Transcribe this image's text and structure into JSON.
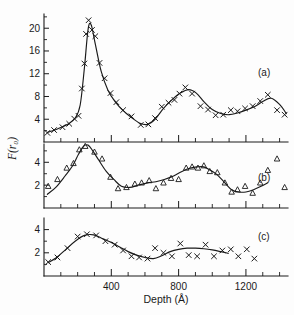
{
  "figure": {
    "title": "",
    "xlabel": "Depth (Å)",
    "ylabel": "F(r₀)",
    "panel_labels": [
      "(a)",
      "(b)",
      "(c)"
    ],
    "ink_color": "#1a1a1a",
    "background_color": "#fdfdfd"
  },
  "axis": {
    "x_ticks_major": [
      "400",
      "800",
      "1200"
    ],
    "x_tick_major_values": [
      400,
      800,
      1200
    ],
    "x_tick_minor_values": [
      100,
      200,
      300,
      500,
      600,
      700,
      900,
      1000,
      1100,
      1300,
      1400
    ],
    "x_range": [
      0,
      1450
    ],
    "panel_a_y_ticks": [
      "4",
      "8",
      "12",
      "16",
      "20"
    ],
    "panel_a_y_tick_values": [
      4,
      8,
      12,
      16,
      20
    ],
    "panel_b_y_ticks": [
      "2",
      "4"
    ],
    "panel_b_y_tick_values": [
      2,
      4
    ],
    "panel_c_y_ticks": [
      "2",
      "4"
    ],
    "panel_c_y_tick_values": [
      2,
      4
    ]
  },
  "chart_data": [
    {
      "type": "scatter",
      "panel": "(a)",
      "title": "",
      "xlabel": "Depth (Å)",
      "ylabel": "F(r₀)",
      "xlim": [
        0,
        1450
      ],
      "ylim": [
        0,
        22.5
      ],
      "grid": false,
      "legend": "none",
      "marker": "x",
      "series": [
        {
          "name": "data-a",
          "marker": "x",
          "x": [
            20,
            60,
            110,
            150,
            180,
            205,
            225,
            240,
            250,
            265,
            285,
            305,
            330,
            360,
            395,
            430,
            470,
            520,
            575,
            620,
            660,
            700,
            740,
            775,
            805,
            840,
            880,
            930,
            975,
            1020,
            1065,
            1110,
            1150,
            1195,
            1240,
            1285,
            1330,
            1385,
            1430
          ],
          "y": [
            1.6,
            2.1,
            2.6,
            3.2,
            4.1,
            4.6,
            9.4,
            13.8,
            19.0,
            21.4,
            19.7,
            18.6,
            13.9,
            11.2,
            8.6,
            7.0,
            5.6,
            4.5,
            3.0,
            3.1,
            4.2,
            6.2,
            6.9,
            7.4,
            8.5,
            9.6,
            8.5,
            6.3,
            5.7,
            4.7,
            4.8,
            5.6,
            5.4,
            5.9,
            6.3,
            7.2,
            8.3,
            5.6,
            4.8
          ]
        }
      ],
      "fitted_curve": {
        "name": "fit-a",
        "x": [
          20,
          80,
          140,
          185,
          215,
          240,
          262,
          280,
          305,
          340,
          380,
          425,
          470,
          520,
          570,
          615,
          660,
          710,
          760,
          810,
          860,
          905,
          950,
          1000,
          1050,
          1100,
          1150,
          1200,
          1250,
          1300,
          1350,
          1400,
          1440
        ],
        "y": [
          1.7,
          2.3,
          3.1,
          4.2,
          6.5,
          13.0,
          19.8,
          20.6,
          17.2,
          12.4,
          9.1,
          7.0,
          5.5,
          4.3,
          3.3,
          3.1,
          4.0,
          5.9,
          7.4,
          8.6,
          9.2,
          8.6,
          7.1,
          5.7,
          5.0,
          4.8,
          5.1,
          5.6,
          6.2,
          7.1,
          7.7,
          6.6,
          5.0
        ]
      }
    },
    {
      "type": "scatter",
      "panel": "(b)",
      "title": "",
      "xlabel": "Depth (Å)",
      "ylabel": "F(r₀)",
      "xlim": [
        0,
        1450
      ],
      "ylim": [
        0,
        5.6
      ],
      "grid": false,
      "legend": "none",
      "marker": "triangle",
      "series": [
        {
          "name": "data-b",
          "marker": "triangle",
          "x": [
            25,
            80,
            135,
            175,
            210,
            245,
            300,
            345,
            395,
            440,
            490,
            540,
            580,
            625,
            665,
            710,
            755,
            800,
            845,
            880,
            915,
            950,
            985,
            1030,
            1075,
            1115,
            1150,
            1195,
            1240,
            1285,
            1330,
            1385,
            1430
          ],
          "y": [
            1.9,
            2.5,
            3.5,
            3.9,
            5.1,
            5.4,
            4.9,
            4.3,
            2.7,
            1.7,
            1.8,
            2.1,
            2.2,
            2.4,
            1.7,
            2.2,
            2.6,
            2.5,
            3.5,
            3.6,
            3.5,
            3.7,
            3.2,
            3.1,
            2.2,
            1.4,
            1.6,
            1.9,
            1.3,
            2.2,
            3.3,
            4.3,
            1.8
          ]
        }
      ],
      "fitted_curve": {
        "name": "fit-b",
        "x": [
          20,
          70,
          125,
          170,
          205,
          235,
          262,
          290,
          325,
          370,
          415,
          460,
          510,
          560,
          615,
          665,
          715,
          770,
          820,
          870,
          910,
          950,
          990,
          1030,
          1075,
          1115,
          1155,
          1200,
          1245,
          1290,
          1330
        ],
        "y": [
          1.2,
          1.8,
          2.8,
          3.7,
          4.7,
          5.4,
          5.5,
          5.0,
          4.2,
          3.2,
          2.5,
          1.9,
          1.8,
          2.0,
          2.2,
          2.3,
          2.5,
          2.8,
          3.2,
          3.5,
          3.6,
          3.6,
          3.3,
          2.9,
          2.2,
          1.6,
          1.4,
          1.4,
          1.6,
          1.9,
          2.2
        ]
      }
    },
    {
      "type": "scatter",
      "panel": "(c)",
      "title": "",
      "xlabel": "Depth (Å)",
      "ylabel": "F(r₀)",
      "xlim": [
        0,
        1450
      ],
      "ylim": [
        0,
        5.0
      ],
      "grid": false,
      "legend": "none",
      "marker": "x",
      "series": [
        {
          "name": "data-c",
          "marker": "x",
          "x": [
            25,
            80,
            140,
            200,
            255,
            310,
            365,
            420,
            470,
            520,
            565,
            615,
            660,
            710,
            760,
            810,
            860,
            910,
            960,
            1010,
            1060,
            1110,
            1155,
            1205,
            1250
          ],
          "y": [
            1.2,
            1.6,
            2.4,
            3.4,
            3.6,
            3.5,
            3.0,
            2.7,
            2.2,
            1.7,
            1.6,
            1.5,
            2.4,
            2.0,
            1.7,
            2.8,
            1.8,
            1.7,
            2.7,
            1.7,
            2.2,
            2.3,
            1.7,
            2.3,
            1.5
          ]
        }
      ],
      "fitted_curve": {
        "name": "fit-c",
        "x": [
          25,
          75,
          130,
          185,
          240,
          295,
          350,
          400,
          450,
          500,
          550,
          600,
          650,
          700,
          750,
          800,
          850,
          900,
          950,
          1000,
          1050,
          1095
        ],
        "y": [
          1.15,
          1.6,
          2.3,
          3.0,
          3.5,
          3.55,
          3.2,
          2.9,
          2.5,
          2.1,
          1.8,
          1.6,
          1.5,
          1.75,
          2.1,
          2.3,
          2.4,
          2.4,
          2.35,
          2.25,
          2.1,
          1.95
        ]
      }
    }
  ]
}
